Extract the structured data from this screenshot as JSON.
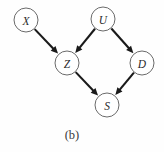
{
  "figure": {
    "caption": "(b)",
    "caption_x": 72,
    "caption_y": 135,
    "background_color": "#fefefe",
    "node_fill_color": "#ffffff",
    "node_stroke_color": "#595959",
    "edge_color": "#1a1a1a",
    "label_color": "#2b2b2b",
    "node_radius": 12
  },
  "chart_data": {
    "type": "diagram",
    "diagram_kind": "directed-acyclic-graph",
    "title": "(b)",
    "nodes": [
      {
        "id": "X",
        "label": "X",
        "x": 26,
        "y": 20
      },
      {
        "id": "U",
        "label": "U",
        "x": 103,
        "y": 19
      },
      {
        "id": "Z",
        "label": "Z",
        "x": 67,
        "y": 63
      },
      {
        "id": "D",
        "label": "D",
        "x": 142,
        "y": 63
      },
      {
        "id": "S",
        "label": "S",
        "x": 107,
        "y": 105
      }
    ],
    "edges": [
      {
        "from": "X",
        "to": "Z",
        "directed": true
      },
      {
        "from": "U",
        "to": "Z",
        "directed": true
      },
      {
        "from": "U",
        "to": "D",
        "directed": true
      },
      {
        "from": "Z",
        "to": "S",
        "directed": true
      },
      {
        "from": "D",
        "to": "S",
        "directed": true
      }
    ]
  }
}
